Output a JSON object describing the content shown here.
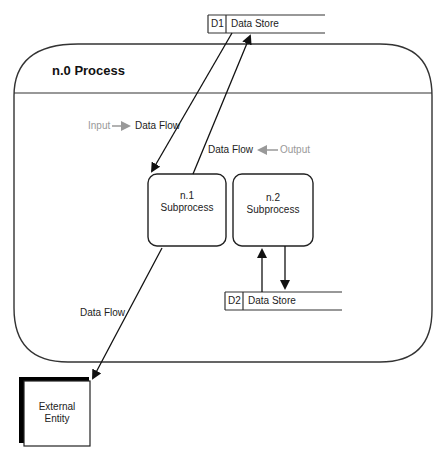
{
  "process": {
    "title": "n.0 Process"
  },
  "data_stores": [
    {
      "id": "D1",
      "label": "Data Store"
    },
    {
      "id": "D2",
      "label": "Data Store"
    }
  ],
  "subprocesses": [
    {
      "number": "n.1",
      "label": "Subprocess"
    },
    {
      "number": "n.2",
      "label": "Subprocess"
    }
  ],
  "external_entity": {
    "line1": "External",
    "line2": "Entity"
  },
  "flows": {
    "input_legend": {
      "prefix": "Input",
      "label": "Data Flow"
    },
    "output_legend": {
      "label": "Data Flow",
      "suffix": "Output"
    },
    "external_flow": {
      "label": "Data Flow"
    }
  },
  "colors": {
    "stroke": "#222222",
    "legend_grey": "#999999",
    "background": "#ffffff"
  }
}
